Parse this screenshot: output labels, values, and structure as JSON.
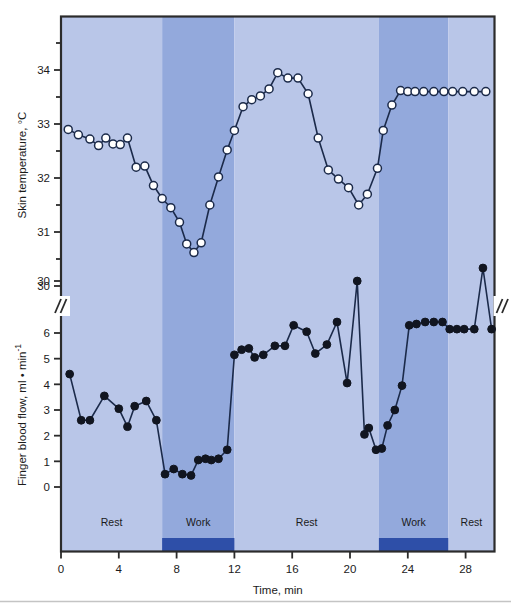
{
  "chart_data": {
    "type": "line",
    "title": "",
    "xlabel": "Time, min",
    "xlim": [
      0,
      30
    ],
    "xticks": [
      0,
      4,
      8,
      12,
      16,
      20,
      24,
      28
    ],
    "xtick_labels": [
      "0",
      "4",
      "8",
      "12",
      "16",
      "20",
      "24",
      "28"
    ],
    "grid": false,
    "legend": "none",
    "panels": [
      {
        "name": "skin-temperature",
        "ylabel": "Skin temperature, °C",
        "ylim": [
          30.3,
          34.55
        ],
        "yticks": [
          30,
          31,
          32,
          33,
          34
        ],
        "ytick_labels": [
          "30",
          "31",
          "32",
          "33",
          "34"
        ],
        "minor_yticks": [
          30.5,
          31.5,
          32.5,
          33.5,
          34.5
        ],
        "marker": "open-circle",
        "marker_fill": "#ffffff",
        "marker_edge": "#1b2a4a",
        "line_color": "#1b2a4a",
        "series": [
          {
            "name": "Skin temperature",
            "x": [
              0.5,
              1.2,
              2.0,
              2.6,
              3.1,
              3.6,
              4.1,
              4.6,
              5.2,
              5.8,
              6.4,
              7.0,
              7.6,
              8.2,
              8.7,
              9.2,
              9.7,
              10.3,
              10.9,
              11.5,
              12.0,
              12.6,
              13.2,
              13.8,
              14.4,
              15.0,
              15.7,
              16.4,
              17.1,
              17.8,
              18.5,
              19.2,
              19.9,
              20.6,
              21.2,
              21.9,
              22.3,
              22.9,
              23.5,
              24.0,
              24.5,
              25.1,
              25.8,
              26.5,
              27.1,
              27.8,
              28.6,
              29.4
            ],
            "y": [
              32.9,
              32.8,
              32.72,
              32.6,
              32.74,
              32.63,
              32.62,
              32.74,
              32.2,
              32.22,
              31.86,
              31.62,
              31.45,
              31.18,
              30.78,
              30.62,
              30.8,
              31.5,
              32.02,
              32.52,
              32.88,
              33.32,
              33.45,
              33.52,
              33.65,
              33.95,
              33.85,
              33.85,
              33.56,
              32.74,
              32.15,
              31.98,
              31.82,
              31.5,
              31.7,
              32.18,
              32.88,
              33.35,
              33.62,
              33.6,
              33.6,
              33.6,
              33.6,
              33.6,
              33.6,
              33.6,
              33.6,
              33.6
            ]
          }
        ]
      },
      {
        "name": "finger-blood-flow",
        "ylabel": "Finger blood flow, ml • min⁻¹",
        "ylim": [
          -0.55,
          7.4
        ],
        "yticks": [
          0,
          1,
          2,
          3,
          4,
          5,
          6
        ],
        "ytick_labels": [
          "0",
          "1",
          "2",
          "3",
          "4",
          "5",
          "6"
        ],
        "broken_axis": true,
        "broken_axis_tick": 30,
        "broken_axis_tick_label": "30",
        "marker": "filled-circle",
        "marker_fill": "#111520",
        "line_color": "#1b2a4a",
        "series": [
          {
            "name": "Finger blood flow",
            "x": [
              0.6,
              1.4,
              2.0,
              3.0,
              4.0,
              4.6,
              5.1,
              5.9,
              6.6,
              7.2,
              7.8,
              8.4,
              9.0,
              9.5,
              10.0,
              10.4,
              10.9,
              11.5,
              12.0,
              12.5,
              13.0,
              13.4,
              14.0,
              14.8,
              15.5,
              16.1,
              17.0,
              17.6,
              18.4,
              19.1,
              19.8,
              20.5,
              21.0,
              21.3,
              21.8,
              22.2,
              22.6,
              23.1,
              23.6,
              24.1,
              24.6,
              25.2,
              25.8,
              26.4,
              26.9,
              27.4,
              27.9,
              28.6,
              29.2,
              29.8
            ],
            "y": [
              4.4,
              2.6,
              2.6,
              3.55,
              3.05,
              2.35,
              3.15,
              3.35,
              2.6,
              0.5,
              0.7,
              0.5,
              0.45,
              1.05,
              1.1,
              1.05,
              1.1,
              1.45,
              5.15,
              5.35,
              5.4,
              5.05,
              5.15,
              5.5,
              5.5,
              6.3,
              6.05,
              5.2,
              5.55,
              6.85,
              4.05,
              4.6,
              2.05,
              2.3,
              1.45,
              1.5,
              2.4,
              3.0,
              3.95,
              6.3,
              6.35,
              6.5,
              7.0,
              6.75,
              6.15,
              6.15,
              6.15,
              6.15,
              6.15,
              6.15
            ]
          }
        ],
        "offscale_points": [
          {
            "x": 20.5,
            "y_display": 30,
            "label": "peak near 30"
          },
          {
            "x": 29.2,
            "y_display": 30,
            "label": "peak above 30"
          }
        ]
      }
    ],
    "activity_bands": [
      {
        "label": "Rest",
        "start": 0,
        "end": 7.0,
        "shade": "light",
        "bar": false
      },
      {
        "label": "Work",
        "start": 7.0,
        "end": 12.0,
        "shade": "dark",
        "bar": true
      },
      {
        "label": "Rest",
        "start": 12.0,
        "end": 22.0,
        "shade": "light",
        "bar": false
      },
      {
        "label": "Work",
        "start": 22.0,
        "end": 26.8,
        "shade": "dark",
        "bar": true
      },
      {
        "label": "Rest",
        "start": 26.8,
        "end": 30.0,
        "shade": "light",
        "bar": false
      }
    ],
    "colors": {
      "band_light": "#b9c6e8",
      "band_dark": "#93a9dc",
      "work_bar": "#2e4fa8",
      "line": "#1b2a4a",
      "marker_open": "#ffffff",
      "marker_filled": "#111520",
      "frame": "#2b2b2b",
      "text": "#1b1b1b",
      "page_background": "#ffffff"
    }
  }
}
